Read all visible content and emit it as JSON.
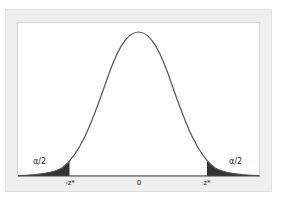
{
  "diagram": {
    "type": "normal-distribution-two-tailed",
    "tail_labels": {
      "left": "α/2",
      "right": "α/2"
    },
    "x_ticks": [
      "-z*",
      "0",
      "z*"
    ],
    "colors": {
      "curve": "#555555",
      "shade": "#333333",
      "frame": "#efefef",
      "plot_bg": "#ffffff"
    }
  }
}
